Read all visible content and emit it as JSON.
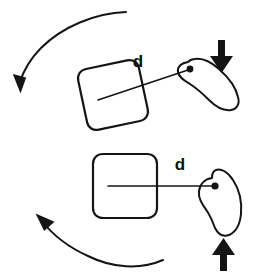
{
  "figure": {
    "background_color": "#ffffff",
    "ink_color": "#141414",
    "width": 261,
    "height": 277
  },
  "panels": [
    {
      "id": "top-panel",
      "name": "tilted-configuration",
      "distance_label": "d",
      "square": {
        "name": "rounded-square-tilted",
        "rotation_deg": -12,
        "center_x": 113,
        "center_y": 95,
        "size": 62
      },
      "blob": {
        "name": "irregular-blob-tilted",
        "attach_dot_x": 190,
        "attach_dot_y": 69
      },
      "connector": {
        "from_x": 113,
        "from_y": 95,
        "to_x": 190,
        "to_y": 69
      },
      "arc_arrow": {
        "name": "counterclockwise-arc-arrow",
        "direction": "down-left"
      },
      "force_arrow": {
        "name": "down-arrow",
        "direction": "down",
        "x": 222,
        "y": 45
      }
    },
    {
      "id": "bottom-panel",
      "name": "upright-configuration",
      "distance_label": "d",
      "square": {
        "name": "rounded-square-upright",
        "rotation_deg": 0,
        "center_x": 125,
        "center_y": 186,
        "size": 64
      },
      "blob": {
        "name": "irregular-blob-comma",
        "attach_dot_x": 215,
        "attach_dot_y": 186
      },
      "connector": {
        "from_x": 125,
        "from_y": 186,
        "to_x": 215,
        "to_y": 186
      },
      "arc_arrow": {
        "name": "clockwise-arc-arrow",
        "direction": "up-left"
      },
      "force_arrow": {
        "name": "up-arrow",
        "direction": "up",
        "x": 224,
        "y": 252
      }
    }
  ],
  "labels": {
    "top_distance": "d",
    "bottom_distance": "d"
  }
}
